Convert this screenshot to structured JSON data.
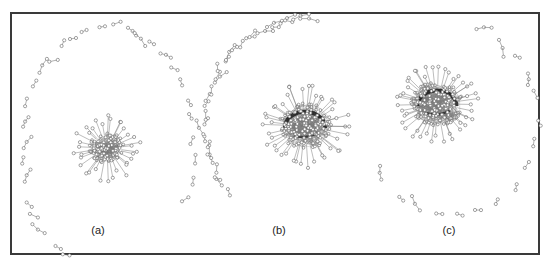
{
  "figure": {
    "panels": [
      {
        "id": "a",
        "label": "(a)",
        "label_pos": [
          98,
          224
        ],
        "core": {
          "cx": 107,
          "cy": 148,
          "r": 18,
          "spokes": 34,
          "spoke_len": 16,
          "density": "medium",
          "dark_band": false
        },
        "ring": {
          "cx": 108,
          "cy": 148,
          "rx": 86,
          "ry": 122,
          "start_deg": 115,
          "end_deg": 390,
          "pairs": 30
        }
      },
      {
        "id": "b",
        "label": "(b)",
        "label_pos": [
          279,
          224
        ],
        "core": {
          "cx": 305,
          "cy": 126,
          "r": 27,
          "spokes": 42,
          "spoke_len": 18,
          "density": "high",
          "dark_band": true
        },
        "ring": {
          "cx": 305,
          "cy": 126,
          "rx": 100,
          "ry": 106,
          "start_deg": 140,
          "end_deg": 272,
          "pairs": 30
        }
      },
      {
        "id": "c",
        "label": "(c)",
        "label_pos": [
          449,
          224
        ],
        "core": {
          "cx": 437,
          "cy": 104,
          "r": 26,
          "spokes": 44,
          "spoke_len": 17,
          "density": "high",
          "dark_band": true
        },
        "ring": {
          "cx": 450,
          "cy": 120,
          "rx": 88,
          "ry": 96,
          "start_deg": -75,
          "end_deg": 150,
          "pairs": 16
        }
      }
    ],
    "colors": {
      "frame": "#3a3a3a",
      "edge": "#7a7a7a",
      "node_stroke": "#666666",
      "node_fill": "#ffffff",
      "core_dark": "#1a1a1a"
    }
  }
}
